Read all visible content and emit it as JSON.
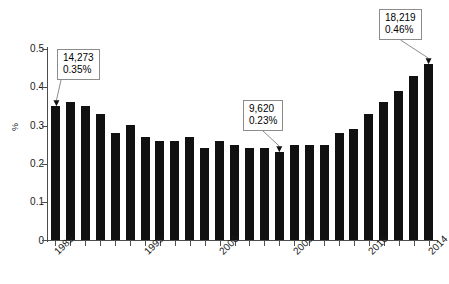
{
  "chart_data": {
    "type": "bar",
    "title": "",
    "subtitle": "",
    "xlabel": "",
    "ylabel": "%",
    "ylim": [
      0,
      0.5
    ],
    "grid": false,
    "legend": null,
    "categories": [
      "1989",
      "1990",
      "1991",
      "1992",
      "1993",
      "1994",
      "1995",
      "1996",
      "1997",
      "1998",
      "1999",
      "2000",
      "2001",
      "2002",
      "2003",
      "2004",
      "2005",
      "2006",
      "2007",
      "2008",
      "2009",
      "2010",
      "2011",
      "2012",
      "2013",
      "2014"
    ],
    "values": [
      0.35,
      0.36,
      0.35,
      0.33,
      0.28,
      0.3,
      0.27,
      0.26,
      0.26,
      0.27,
      0.24,
      0.26,
      0.25,
      0.24,
      0.24,
      0.23,
      0.25,
      0.25,
      0.25,
      0.28,
      0.29,
      0.33,
      0.36,
      0.39,
      0.43,
      0.46
    ],
    "x_tick_labels": [
      "1989",
      "1995",
      "2000",
      "2005",
      "2010",
      "2014"
    ],
    "y_tick_labels": [
      "0",
      "0.1",
      "0.2",
      "0.3",
      "0.4",
      "0.5"
    ],
    "y_tick_values": [
      0,
      0.1,
      0.2,
      0.3,
      0.4,
      0.5
    ],
    "bar_color": "#111111",
    "axis_color": "#4d4d4d",
    "annotations": [
      {
        "target_category": "1989",
        "count": "14,273",
        "percent": "0.35%"
      },
      {
        "target_category": "2004",
        "count": "9,620",
        "percent": "0.23%"
      },
      {
        "target_category": "2014",
        "count": "18,219",
        "percent": "0.46%"
      }
    ]
  },
  "axis": {
    "y_label": "%",
    "y_ticks": [
      "0.5",
      "0.4",
      "0.3",
      "0.2",
      "0.1",
      "0"
    ],
    "x_labels": [
      "1989",
      "1995",
      "2000",
      "2005",
      "2010",
      "2014"
    ]
  },
  "annotations": {
    "first": {
      "count": "14,273",
      "percent": "0.35%"
    },
    "middle": {
      "count": "9,620",
      "percent": "0.23%"
    },
    "last": {
      "count": "18,219",
      "percent": "0.46%"
    }
  }
}
